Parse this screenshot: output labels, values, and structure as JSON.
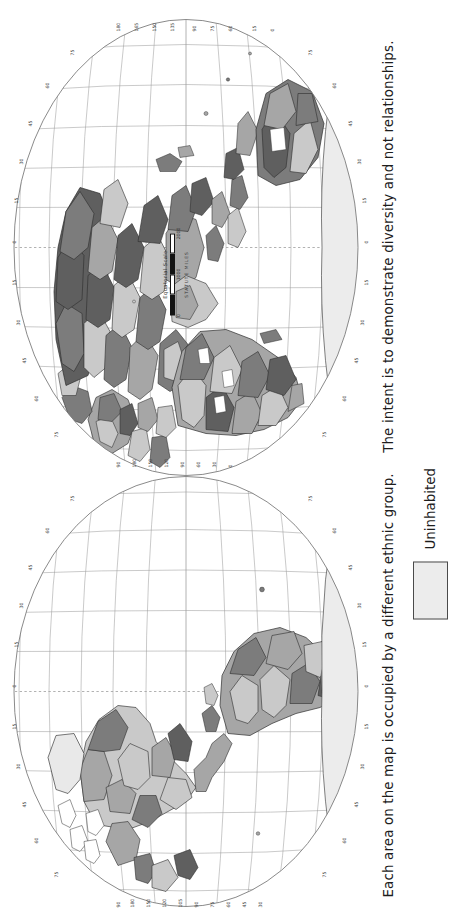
{
  "page": {
    "background": "#ffffff",
    "orientation": "rotated-90-ccw"
  },
  "caption": {
    "sentence1": "Each area on the map is occupied by a different ethnic group.",
    "sentence2": "The intent is to demonstrate diversity and not relationships."
  },
  "legend": {
    "items": [
      {
        "label": "Uninhabited",
        "color": "#ececec",
        "border": "#4a4a4a"
      }
    ]
  },
  "scale": {
    "title": "Equatorial  Scale",
    "units": "STATUTE  MILES",
    "ticks": [
      "0",
      "1000",
      "2000"
    ]
  },
  "map": {
    "projection": "interrupted-oval-hemispheres",
    "hemispheres": [
      {
        "name": "western-hemisphere",
        "label": "Americas"
      },
      {
        "name": "eastern-hemisphere",
        "label": "Eurasia-Africa-Australia"
      }
    ],
    "graticule": {
      "latitude_interval": 15,
      "longitude_interval": 15,
      "latitude_labels": [
        "75",
        "60",
        "45",
        "30",
        "15",
        "0",
        "15",
        "30",
        "45",
        "60",
        "75"
      ],
      "longitude_labels_west": [
        "90",
        "180",
        "150",
        "120",
        "105",
        "90",
        "75",
        "60",
        "45",
        "30",
        "15",
        "0"
      ],
      "longitude_labels_east": [
        "90",
        "180",
        "165",
        "150",
        "135",
        "120",
        "105",
        "90",
        "75",
        "60",
        "45",
        "30",
        "15",
        "0"
      ]
    },
    "fills": {
      "uninhabited": "#e9e9e9",
      "light_gray": "#c9c9c9",
      "mid_gray": "#a6a6a6",
      "dark_gray": "#7c7c7c",
      "darkest_gray": "#5f5f5f",
      "white": "#ffffff",
      "outline": "#2e2e2e",
      "graticule": "#9a9a9a",
      "ocean": "#ffffff"
    },
    "west_grid_top_labels": [
      "90",
      "180",
      "150",
      "120",
      "105",
      "90",
      "75",
      "60",
      "45",
      "30",
      "15",
      "0"
    ],
    "east_grid_top_labels": [
      "180",
      "165",
      "150",
      "135",
      "120",
      "105",
      "90",
      "75",
      "60",
      "45",
      "30",
      "15",
      "0"
    ]
  }
}
